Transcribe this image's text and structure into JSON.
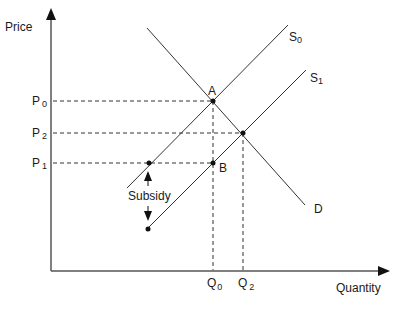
{
  "diagram": {
    "type": "supply-demand-subsidy",
    "axes": {
      "y_label": "Price",
      "x_label": "Quantity"
    },
    "price_levels": [
      {
        "main": "P",
        "sub": "0"
      },
      {
        "main": "P",
        "sub": "2"
      },
      {
        "main": "P",
        "sub": "1"
      }
    ],
    "quantity_levels": [
      {
        "main": "Q",
        "sub": "0"
      },
      {
        "main": "Q",
        "sub": "2"
      }
    ],
    "curves": {
      "supply_0": {
        "main": "S",
        "sub": "0"
      },
      "supply_1": {
        "main": "S",
        "sub": "1"
      },
      "demand": "D"
    },
    "points": {
      "a": "A",
      "b": "B"
    },
    "annotation": "Subsidy"
  }
}
